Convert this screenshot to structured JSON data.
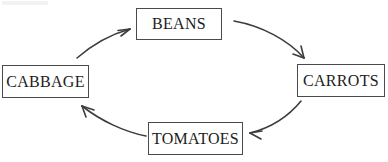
{
  "diagram": {
    "type": "cycle-diagram",
    "direction": "clockwise",
    "background_color": "#ffffff",
    "box_border_color": "#4a4a4a",
    "arrow_color": "#3d3d3d",
    "text_color": "#1c1c1c",
    "nodes": [
      {
        "id": "beans",
        "label": "BEANS",
        "position": "top"
      },
      {
        "id": "carrots",
        "label": "CARROTS",
        "position": "right"
      },
      {
        "id": "tomatoes",
        "label": "TOMATOES",
        "position": "bottom"
      },
      {
        "id": "cabbage",
        "label": "CABBAGE",
        "position": "left"
      }
    ],
    "edges": [
      {
        "id": "cabbage-to-beans",
        "from": "CABBAGE",
        "to": "BEANS",
        "style": "curved-arrow",
        "arrowhead": "open-v"
      },
      {
        "id": "beans-to-carrots",
        "from": "BEANS",
        "to": "CARROTS",
        "style": "curved-arrow",
        "arrowhead": "open-v"
      },
      {
        "id": "carrots-to-tomatoes",
        "from": "CARROTS",
        "to": "TOMATOES",
        "style": "curved-arrow",
        "arrowhead": "open-v"
      },
      {
        "id": "tomatoes-to-cabbage",
        "from": "TOMATOES",
        "to": "CABBAGE",
        "style": "curved-arrow",
        "arrowhead": "open-v"
      }
    ]
  }
}
